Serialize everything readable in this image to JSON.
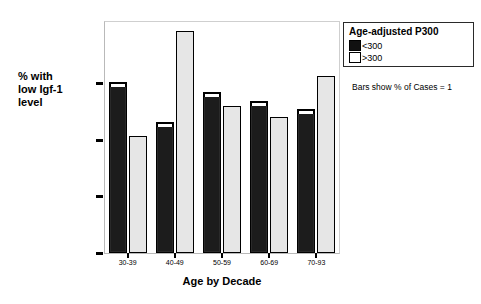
{
  "chart_data": {
    "type": "bar",
    "title": "",
    "xlabel": "Age by Decade",
    "ylabel": "% with low Igf-1 level",
    "ylabel_lines": [
      "% with",
      "low Igf-1",
      "level"
    ],
    "categories": [
      "30-39",
      "40-49",
      "50-59",
      "60-69",
      "70-93"
    ],
    "series": [
      {
        "name": "<300",
        "color": "#1c1c1c",
        "values": [
          30.3,
          23.2,
          28.4,
          26.8,
          25.4
        ]
      },
      {
        "name": ">300",
        "color": "#e6e6e6",
        "values": [
          20.7,
          39.2,
          26.0,
          24.0,
          31.2
        ]
      }
    ],
    "ylim": [
      0,
      41
    ],
    "yticks": [
      0,
      10,
      20,
      30
    ],
    "ytick_labels": [
      "0",
      "10",
      "20",
      "30"
    ],
    "grid": false,
    "legend_position": "top-right"
  },
  "legend": {
    "title": "Age-adjusted P300",
    "entries": [
      {
        "label": "<300",
        "swatch": "dark"
      },
      {
        "label": ">300",
        "swatch": "light"
      }
    ]
  },
  "caption": {
    "text": "Bars show % of Cases = 1"
  },
  "colors": {
    "dark_bar": "#1c1c1c",
    "light_bar": "#e6e6e6",
    "frame": "#b9b9b9",
    "text": "#000000"
  }
}
